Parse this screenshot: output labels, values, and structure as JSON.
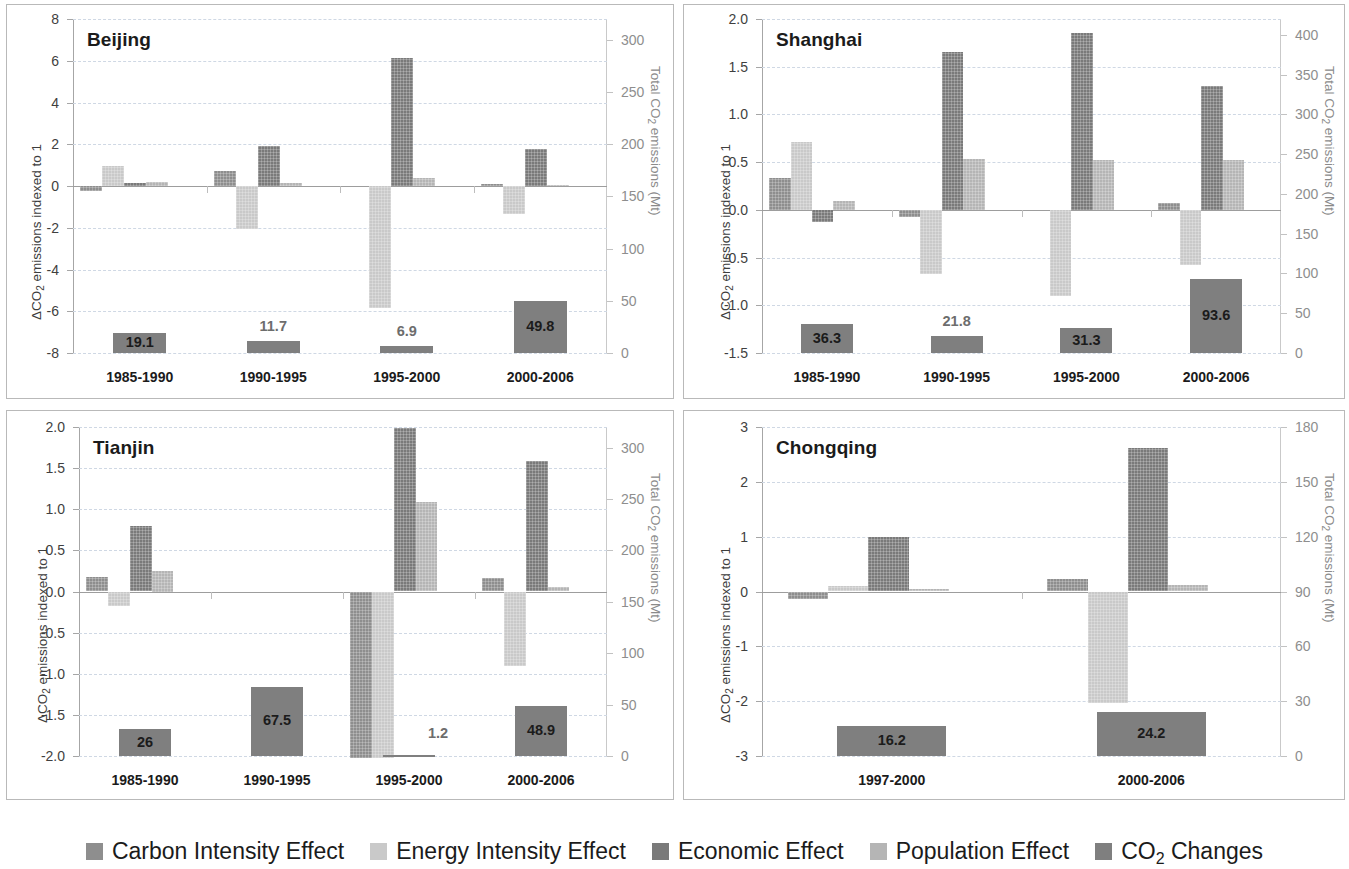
{
  "figure": {
    "background": "#ffffff",
    "series_colors": [
      "#8e8e8e",
      "#c9c9c9",
      "#7a7a7a",
      "#b5b5b5",
      "#7f7f7f"
    ]
  },
  "legend": {
    "items": [
      {
        "label": "Carbon Intensity Effect",
        "color": "#8e8e8e",
        "key": "carbon"
      },
      {
        "label": "Energy Intensity Effect",
        "color": "#c9c9c9",
        "key": "energy"
      },
      {
        "label": "Economic Effect",
        "color": "#7a7a7a",
        "key": "economic"
      },
      {
        "label": "Population Effect",
        "color": "#b5b5b5",
        "key": "population"
      },
      {
        "label": "CO2 Changes",
        "color": "#7f7f7f",
        "key": "co2",
        "label_pre": "CO",
        "label_sub": "2",
        "label_post": " Changes"
      }
    ]
  },
  "chart_data": [
    {
      "id": "beijing",
      "type": "bar",
      "title": "Beijing",
      "ylabel": "ΔCO2 emissions indexed to 1",
      "ylabel_pre": "ΔCO",
      "ylabel_sub": "2",
      "ylabel_post": " emissions indexed to 1",
      "y2label": "Total CO2 emissions (Mt)",
      "y2label_pre": "Total CO",
      "y2label_sub": "2",
      "y2label_post": " emissions (Mt)",
      "categories": [
        "1985-1990",
        "1990-1995",
        "1995-2000",
        "2000-2006"
      ],
      "ylim": [
        -8,
        8
      ],
      "yticks": [
        -8,
        -6,
        -4,
        -2,
        0,
        2,
        4,
        6,
        8
      ],
      "ytick_labels": [
        "-8",
        "-6",
        "-4",
        "-2",
        "0",
        "2",
        "4",
        "6",
        "8"
      ],
      "y2lim": [
        0,
        320
      ],
      "y2ticks": [
        0,
        50,
        100,
        150,
        200,
        250,
        300
      ],
      "y2tick_labels": [
        "0",
        "50",
        "100",
        "150",
        "200",
        "250",
        "300"
      ],
      "grid": true,
      "series": [
        {
          "name": "Carbon Intensity Effect",
          "values": [
            -0.25,
            0.73,
            0.0,
            0.08
          ]
        },
        {
          "name": "Energy Intensity Effect",
          "values": [
            0.97,
            -2.05,
            -5.85,
            -1.35
          ]
        },
        {
          "name": "Economic Effect",
          "values": [
            0.13,
            1.93,
            6.15,
            1.77
          ]
        },
        {
          "name": "Population Effect",
          "values": [
            0.18,
            0.15,
            0.4,
            0.07
          ]
        }
      ],
      "totals": {
        "name": "CO2 Changes",
        "values": [
          19.1,
          11.7,
          6.9,
          49.8
        ],
        "labels": [
          "19.1",
          "11.7",
          "6.9",
          "49.8"
        ],
        "label_inside": [
          true,
          false,
          false,
          true
        ]
      }
    },
    {
      "id": "shanghai",
      "type": "bar",
      "title": "Shanghai",
      "ylabel": "ΔCO2 emissions indexed to 1",
      "ylabel_pre": "ΔCO",
      "ylabel_sub": "2",
      "ylabel_post": " emissions indexed to 1",
      "y2label": "Total CO2 emissions (Mt)",
      "y2label_pre": "Total CO",
      "y2label_sub": "2",
      "y2label_post": " emissions (Mt)",
      "categories": [
        "1985-1990",
        "1990-1995",
        "1995-2000",
        "2000-2006"
      ],
      "ylim": [
        -1.5,
        2.0
      ],
      "yticks": [
        -1.5,
        -1.0,
        -0.5,
        0.0,
        0.5,
        1.0,
        1.5,
        2.0
      ],
      "ytick_labels": [
        "-1.5",
        "-1.0",
        "-0.5",
        "0.0",
        "0.5",
        "1.0",
        "1.5",
        "2.0"
      ],
      "y2lim": [
        0,
        420
      ],
      "y2ticks": [
        0,
        50,
        100,
        150,
        200,
        250,
        300,
        350,
        400
      ],
      "y2tick_labels": [
        "0",
        "50",
        "100",
        "150",
        "200",
        "250",
        "300",
        "350",
        "400"
      ],
      "grid": true,
      "series": [
        {
          "name": "Carbon Intensity Effect",
          "values": [
            0.33,
            -0.07,
            0.0,
            0.07
          ]
        },
        {
          "name": "Energy Intensity Effect",
          "values": [
            0.71,
            -0.67,
            -0.9,
            -0.58
          ]
        },
        {
          "name": "Economic Effect",
          "values": [
            -0.13,
            1.65,
            1.85,
            1.3
          ]
        },
        {
          "name": "Population Effect",
          "values": [
            0.09,
            0.53,
            0.52,
            0.52
          ]
        }
      ],
      "totals": {
        "name": "CO2 Changes",
        "values": [
          36.3,
          21.8,
          31.3,
          93.6
        ],
        "labels": [
          "36.3",
          "21.8",
          "31.3",
          "93.6"
        ],
        "label_inside": [
          true,
          false,
          true,
          true
        ]
      }
    },
    {
      "id": "tianjin",
      "type": "bar",
      "title": "Tianjin",
      "ylabel": "ΔCO2 emissions indexed to 1",
      "ylabel_pre": "ΔCO",
      "ylabel_sub": "2",
      "ylabel_post": " emissions indexed to 1",
      "y2label": "Total CO2 emissions (Mt)",
      "y2label_pre": "Total CO",
      "y2label_sub": "2",
      "y2label_post": " emissions (Mt)",
      "categories": [
        "1985-1990",
        "1990-1995",
        "1995-2000",
        "2000-2006"
      ],
      "ylim": [
        -2.0,
        2.0
      ],
      "yticks": [
        -2.0,
        -1.5,
        -1.0,
        -0.5,
        0.0,
        0.5,
        1.0,
        1.5,
        2.0
      ],
      "ytick_labels": [
        "-2.0",
        "-1.5",
        "-1.0",
        "-0.5",
        "0.0",
        "0.5",
        "1.0",
        "1.5",
        "2.0"
      ],
      "y2lim": [
        0,
        320
      ],
      "y2ticks": [
        0,
        50,
        100,
        150,
        200,
        250,
        300
      ],
      "y2tick_labels": [
        "0",
        "50",
        "100",
        "150",
        "200",
        "250",
        "300"
      ],
      "grid": true,
      "series": [
        {
          "name": "Carbon Intensity Effect",
          "values": [
            0.18,
            0.0,
            -2.03,
            0.16
          ]
        },
        {
          "name": "Energy Intensity Effect",
          "values": [
            -0.18,
            0.0,
            -2.03,
            -0.9
          ]
        },
        {
          "name": "Economic Effect",
          "values": [
            0.8,
            0.0,
            1.99,
            1.59
          ]
        },
        {
          "name": "Population Effect",
          "values": [
            0.25,
            0.0,
            1.09,
            0.06
          ]
        }
      ],
      "totals": {
        "name": "CO2 Changes",
        "values": [
          26,
          67.5,
          1.2,
          48.9
        ],
        "labels": [
          "26",
          "67.5",
          "1.2",
          "48.9"
        ],
        "label_inside": [
          true,
          true,
          false,
          true
        ]
      }
    },
    {
      "id": "chongqing",
      "type": "bar",
      "title": "Chongqing",
      "ylabel": "ΔCO2 emissions indexed to 1",
      "ylabel_pre": "ΔCO",
      "ylabel_sub": "2",
      "ylabel_post": " emissions indexed to 1",
      "y2label": "Total CO2 emissions (Mt)",
      "y2label_pre": "Total CO",
      "y2label_sub": "2",
      "y2label_post": " emissions (Mt)",
      "categories": [
        "1997-2000",
        "2000-2006"
      ],
      "ylim": [
        -3,
        3
      ],
      "yticks": [
        -3,
        -2,
        -1,
        0,
        1,
        2,
        3
      ],
      "ytick_labels": [
        "-3",
        "-2",
        "-1",
        "0",
        "1",
        "2",
        "3"
      ],
      "y2lim": [
        0,
        180
      ],
      "y2ticks": [
        0,
        30,
        60,
        90,
        120,
        150,
        180
      ],
      "y2tick_labels": [
        "0",
        "30",
        "60",
        "90",
        "120",
        "150",
        "180"
      ],
      "grid": true,
      "series": [
        {
          "name": "Carbon Intensity Effect",
          "values": [
            -0.14,
            0.22
          ]
        },
        {
          "name": "Energy Intensity Effect",
          "values": [
            0.1,
            -2.03
          ]
        },
        {
          "name": "Economic Effect",
          "values": [
            1.0,
            2.61
          ]
        },
        {
          "name": "Population Effect",
          "values": [
            0.05,
            0.11
          ]
        }
      ],
      "totals": {
        "name": "CO2 Changes",
        "values": [
          16.2,
          24.2
        ],
        "labels": [
          "16.2",
          "24.2"
        ],
        "label_inside": [
          true,
          true
        ]
      }
    }
  ]
}
